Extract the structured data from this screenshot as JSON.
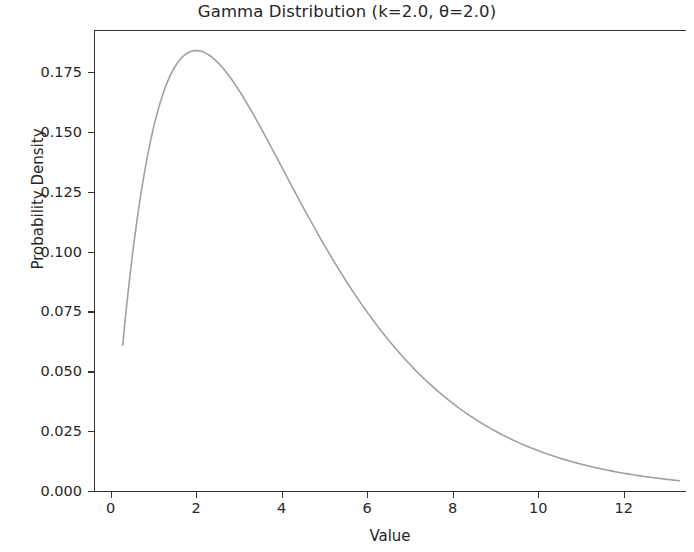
{
  "figure": {
    "background_color": "#ffffff",
    "axes_color": "#333333",
    "text_color": "#262626"
  },
  "chart_data": {
    "type": "line",
    "title": "Gamma Distribution (k=2.0, θ=2.0)",
    "xlabel": "Value",
    "ylabel": "Probability Density",
    "grid": false,
    "legend": null,
    "line_color": "#a0a0a0",
    "line_width": 1.6,
    "xlim": [
      -0.39,
      13.45
    ],
    "ylim": [
      -0.0092,
      0.1925
    ],
    "xticks": [
      0,
      2,
      4,
      6,
      8,
      10,
      12
    ],
    "xticklabels": [
      "0",
      "2",
      "4",
      "6",
      "8",
      "10",
      "12"
    ],
    "yticks": [
      0.0,
      0.025,
      0.05,
      0.075,
      0.1,
      0.125,
      0.15,
      0.175
    ],
    "yticklabels": [
      "0.000",
      "0.025",
      "0.050",
      "0.075",
      "0.100",
      "0.125",
      "0.150",
      "0.175"
    ],
    "distribution": {
      "name": "gamma",
      "shape_k": 2.0,
      "scale_theta": 2.0,
      "peak_x": 2.0,
      "peak_y": 0.1839
    },
    "series": [
      {
        "name": "Gamma PDF",
        "x": [
          0.28,
          0.4,
          0.6,
          0.8,
          1.0,
          1.2,
          1.4,
          1.6,
          1.8,
          2.0,
          2.2,
          2.4,
          2.6,
          2.8,
          3.0,
          3.4,
          3.8,
          4.2,
          4.6,
          5.0,
          5.4,
          5.8,
          6.2,
          6.6,
          7.0,
          7.5,
          8.0,
          8.5,
          9.0,
          9.5,
          10.0,
          10.5,
          11.0,
          11.5,
          12.0,
          12.5,
          13.0,
          13.3
        ],
        "y": [
          0.0609,
          0.0819,
          0.1111,
          0.1341,
          0.1516,
          0.1646,
          0.1737,
          0.1797,
          0.183,
          0.1839,
          0.183,
          0.1807,
          0.1772,
          0.1727,
          0.1674,
          0.155,
          0.1415,
          0.1277,
          0.1142,
          0.1011,
          0.0889,
          0.0776,
          0.0673,
          0.058,
          0.0497,
          0.0406,
          0.033,
          0.0266,
          0.0214,
          0.0171,
          0.0136,
          0.0108,
          0.0085,
          0.0067,
          0.0052,
          0.0041,
          0.0032,
          0.0027
        ]
      }
    ]
  }
}
